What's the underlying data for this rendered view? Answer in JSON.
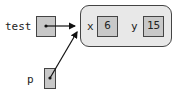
{
  "diagram": {
    "variables": [
      {
        "name": "test",
        "points_to": "point-object"
      },
      {
        "name": "p",
        "points_to": "point-object"
      }
    ],
    "object": {
      "fields": [
        {
          "name": "x",
          "value": "6"
        },
        {
          "name": "y",
          "value": "15"
        }
      ]
    }
  }
}
